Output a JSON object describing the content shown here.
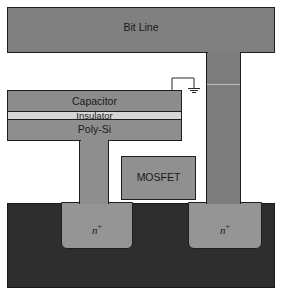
{
  "diagram": {
    "colors": {
      "metal": "#808080",
      "capacitor": "#8c8c8c",
      "insulator": "#d6d6d6",
      "poly": "#8e8e8e",
      "mosfet": "#909090",
      "substrate": "#2e2e2e",
      "nplus": "#959595",
      "outline": "#1e1e1e"
    },
    "labels": {
      "bit_line": "Bit Line",
      "capacitor": "Capacitor",
      "insulator": "Insulator",
      "poly_si": "Poly-Si",
      "mosfet": "MOSFET",
      "nplus_left": "n",
      "nplus_left_sup": "+",
      "nplus_right": "n",
      "nplus_right_sup": "+"
    },
    "icons": {
      "ground": "ground-symbol"
    }
  }
}
